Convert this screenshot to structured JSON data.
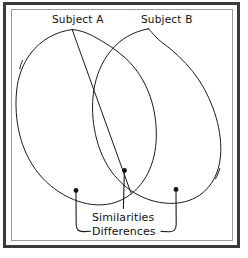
{
  "diagram": {
    "type": "venn",
    "title": "",
    "background_color": "#ffffff",
    "ink_color": "#1b1b1b",
    "frame": {
      "outer_color": "#3a3a3a",
      "inner_color": "#9a9a9a"
    },
    "set_labels": [
      {
        "id": "subject-a",
        "text": "Subject A"
      },
      {
        "id": "subject-b",
        "text": "Subject B"
      }
    ],
    "callouts": [
      {
        "id": "similarities",
        "text": "Similarities",
        "points_to": "overlap-region"
      },
      {
        "id": "differences",
        "text": "Differences",
        "points_to": "outer-regions"
      }
    ],
    "markers": [
      {
        "id": "marker-left",
        "region": "subject-a-only"
      },
      {
        "id": "marker-center",
        "region": "overlap"
      },
      {
        "id": "marker-right",
        "region": "subject-b-only"
      }
    ]
  }
}
